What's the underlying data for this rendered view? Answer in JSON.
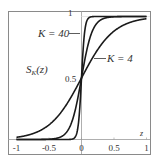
{
  "chart_data": {
    "type": "line",
    "title": "",
    "xlabel": "z",
    "ylabel": "S_K(z)",
    "xlim": [
      -1,
      1
    ],
    "ylim": [
      0,
      1
    ],
    "grid": false,
    "x_ticks": [
      -1,
      -0.5,
      0,
      0.5,
      1
    ],
    "x_tick_labels": [
      "-1",
      "-0.5",
      "0",
      "0.5",
      "1"
    ],
    "y_tick_labels_on_axis": [
      "0.5",
      "1"
    ],
    "function": "S_K(z) = 1 / (1 + exp(-K z))",
    "series": [
      {
        "name": "K = 40",
        "K": 40,
        "labeled": true
      },
      {
        "name": "K = 12",
        "K": 12,
        "labeled": false
      },
      {
        "name": "K = 4",
        "K": 4,
        "labeled": true
      }
    ],
    "annotations": [
      {
        "text": "K = 40",
        "target_series": "K = 40"
      },
      {
        "text": "K = 4",
        "target_series": "K = 4"
      },
      {
        "text": "S_K(z)",
        "role": "function label"
      }
    ],
    "line_color": "#1a1a1a",
    "frame_color": "#8a8a8a"
  },
  "labels": {
    "k40": "K = 40",
    "k4": "K = 4",
    "func_main": "S",
    "func_sub": "K",
    "func_arg": "(z)",
    "y_half": "0.5",
    "y_one": "1",
    "x_axis": "z"
  }
}
